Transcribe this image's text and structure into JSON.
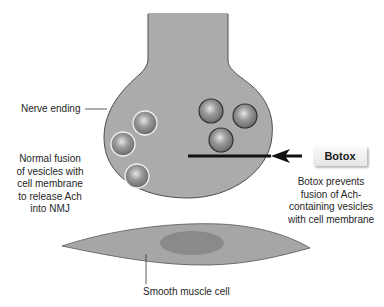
{
  "labels": {
    "nerve_ending": "Nerve ending",
    "normal_fusion": [
      "Normal fusion",
      "of vesicles with",
      "cell membrane",
      "to release Ach",
      "into NMJ"
    ],
    "botox_tag": "Botox",
    "botox_effect": [
      "Botox prevents",
      "fusion of Ach-",
      "containing vesicles",
      "with cell membrane"
    ],
    "smooth_muscle": "Smooth muscle cell"
  },
  "colors": {
    "tissue_gray": "#a9a9a9",
    "outline": "#555555",
    "nucleus": "#8a8a8a",
    "vesicle_fill": "#8c8c8c",
    "bar": "#111111"
  },
  "vesicles": {
    "fused": [
      {
        "cx": 145,
        "cy": 123
      },
      {
        "cx": 123,
        "cy": 144
      },
      {
        "cx": 137,
        "cy": 176
      }
    ],
    "blocked": [
      {
        "cx": 211,
        "cy": 111
      },
      {
        "cx": 245,
        "cy": 116
      },
      {
        "cx": 221,
        "cy": 140
      }
    ]
  }
}
